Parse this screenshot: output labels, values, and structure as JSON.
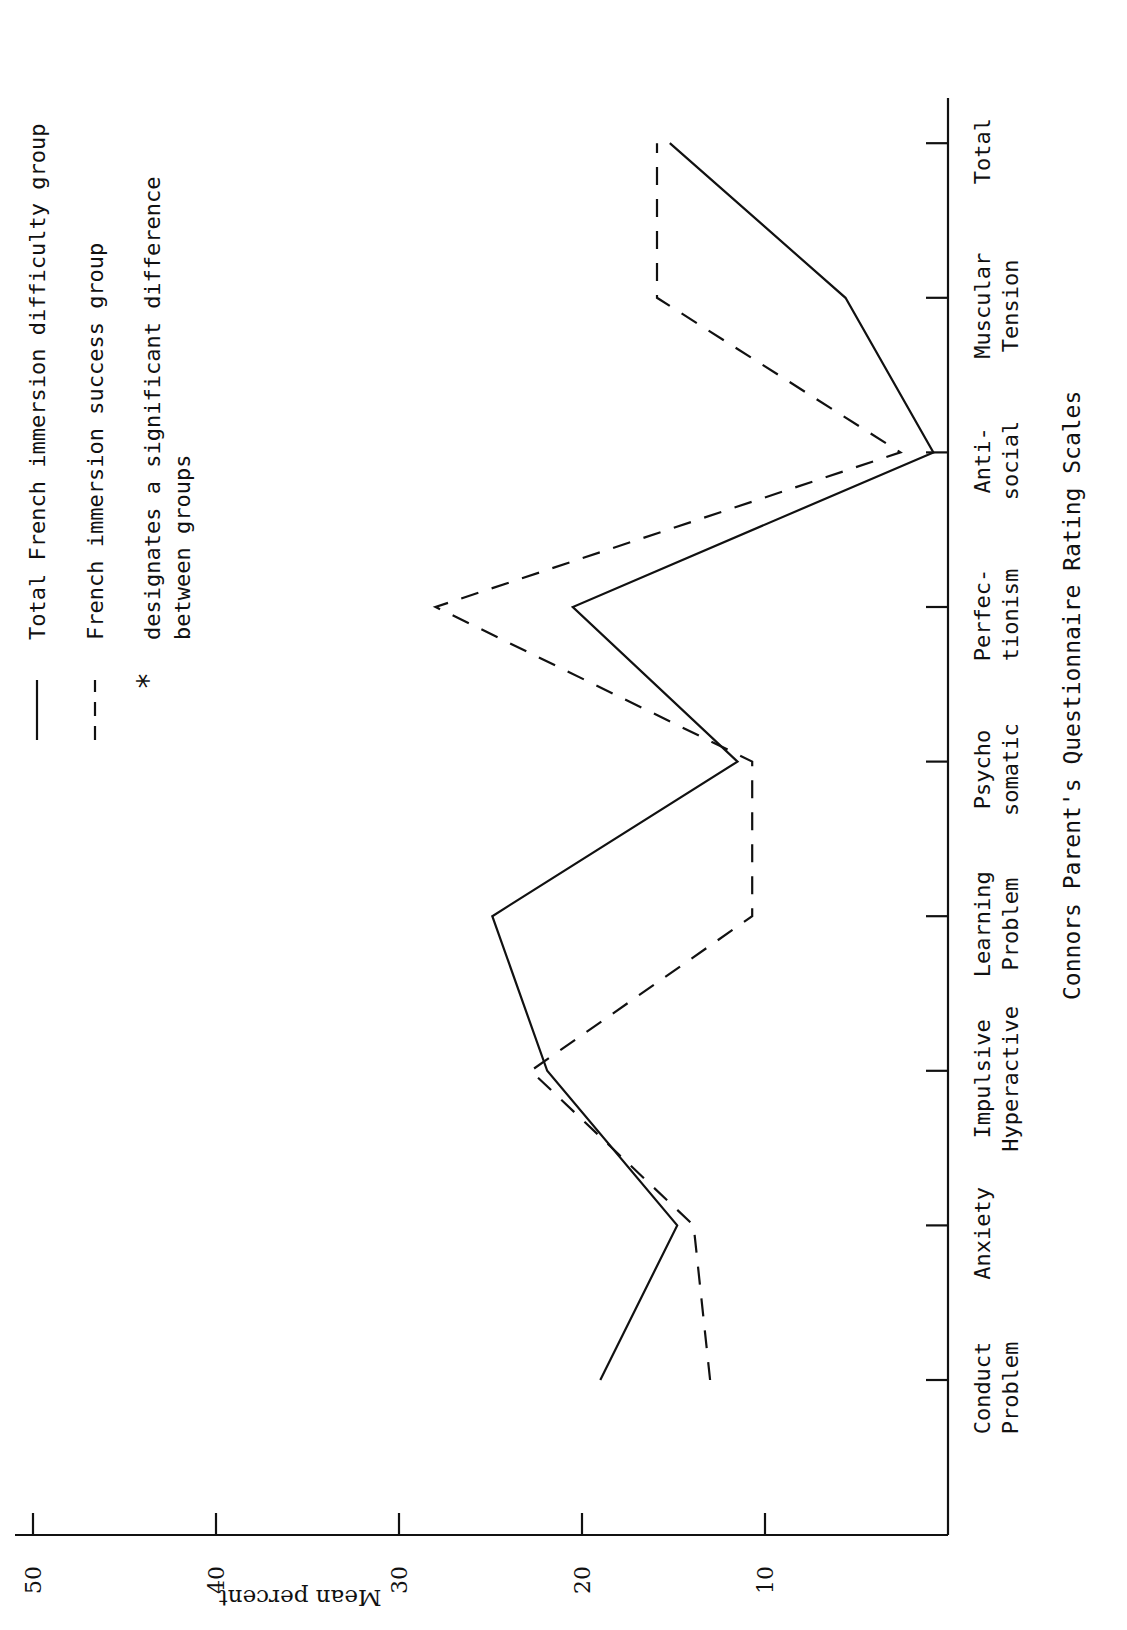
{
  "figure": {
    "orientation": "rotated 90 degrees clockwise",
    "ylabel": "Mean percent",
    "xlabel": "Connors Parent's Questionnaire Rating Scales",
    "legend": {
      "solid": "Total French immersion difficulty group",
      "dashed": "French immersion success group",
      "star_symbol": "*",
      "star_line1": "designates a significant difference",
      "star_line2": "between groups"
    },
    "y_ticks": [
      "50",
      "40",
      "30",
      "20",
      "10"
    ],
    "categories": [
      {
        "line1": "Conduct",
        "line2": "Problem"
      },
      {
        "line1": "Anxiety",
        "line2": ""
      },
      {
        "line1": "Impulsive",
        "line2": "Hyperactive"
      },
      {
        "line1": "Learning",
        "line2": "Problem"
      },
      {
        "line1": "Psycho",
        "line2": "somatic"
      },
      {
        "line1": "Perfec-",
        "line2": "tionism"
      },
      {
        "line1": "Anti-",
        "line2": "social"
      },
      {
        "line1": "Muscular",
        "line2": "Tension"
      },
      {
        "line1": "Total",
        "line2": ""
      }
    ]
  },
  "chart_data": {
    "type": "line",
    "title": "",
    "xlabel": "Connors Parent's Questionnaire Rating Scales",
    "ylabel": "Mean percent",
    "ylim": [
      0,
      50
    ],
    "yticks": [
      10,
      20,
      30,
      40,
      50
    ],
    "grid": false,
    "legend_position": "top (rotated layout: left side of page)",
    "categories": [
      "Conduct Problem",
      "Anxiety",
      "Impulsive Hyperactive",
      "Learning Problem",
      "Psychosomatic",
      "Perfectionism",
      "Anti-social",
      "Muscular Tension",
      "Total"
    ],
    "series": [
      {
        "name": "Total French immersion difficulty group",
        "style": "solid",
        "values": [
          19.0,
          14.8,
          21.9,
          24.9,
          11.5,
          20.5,
          0.8,
          5.6,
          15.2
        ]
      },
      {
        "name": "French immersion success group",
        "style": "dashed",
        "values": [
          13.0,
          13.9,
          22.8,
          10.7,
          10.7,
          28.0,
          2.6,
          15.9,
          15.9
        ]
      }
    ],
    "annotations": [
      "* designates a significant difference between groups"
    ]
  }
}
